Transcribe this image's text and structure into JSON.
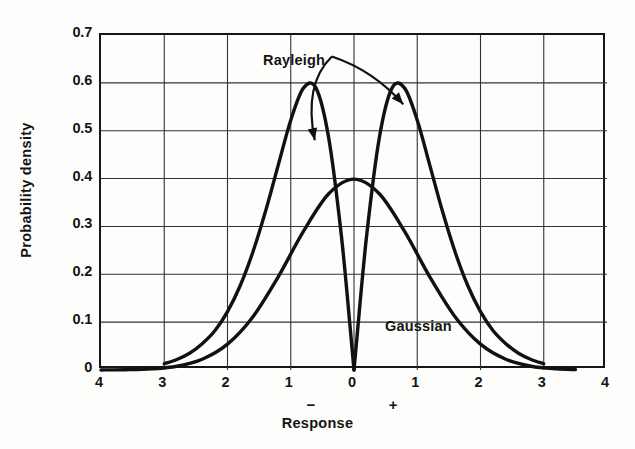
{
  "chart_data": {
    "type": "line",
    "title": "",
    "xlabel": "Response",
    "ylabel": "Probability density",
    "xlim": [
      -4,
      4
    ],
    "ylim": [
      0,
      0.7
    ],
    "grid": true,
    "legend_position": "inline-annotations",
    "y_ticks": [
      "0.7",
      "0.6",
      "0.5",
      "0.4",
      "0.3",
      "0.2",
      "0.1",
      "0"
    ],
    "y_tick_values": [
      0.7,
      0.6,
      0.5,
      0.4,
      0.3,
      0.2,
      0.1,
      0
    ],
    "x_ticks": [
      "4",
      "3",
      "2",
      "1",
      "0",
      "1",
      "2",
      "3",
      "4"
    ],
    "x_tick_values": [
      -4,
      -3,
      -2,
      -1,
      0,
      1,
      2,
      3,
      4
    ],
    "axis_sign_marks": [
      {
        "symbol": "−",
        "x": -0.65
      },
      {
        "symbol": "+",
        "x": 0.65
      }
    ],
    "annotations": [
      {
        "text": "Rayleigh",
        "x": -0.35,
        "y": 0.655,
        "points_to": [
          {
            "x": -0.62,
            "y": 0.48
          },
          {
            "x": 0.78,
            "y": 0.555
          }
        ]
      },
      {
        "text": "Gaussian",
        "x": 1.6,
        "y": 0.115
      }
    ],
    "series": [
      {
        "name": "Rayleigh",
        "color": "#111111",
        "peak_value": 0.6,
        "peak_x": [
          -1,
          1
        ],
        "zero_at": 0,
        "x": [
          -3.0,
          -2.8,
          -2.6,
          -2.4,
          -2.2,
          -2.0,
          -1.8,
          -1.6,
          -1.4,
          -1.2,
          -1.0,
          -0.8,
          -0.6,
          -0.4,
          -0.2,
          -0.05,
          0.0,
          0.05,
          0.2,
          0.4,
          0.6,
          0.8,
          1.0,
          1.2,
          1.4,
          1.6,
          1.8,
          2.0,
          2.2,
          2.4,
          2.6,
          2.8,
          3.0
        ],
        "values": [
          0.013,
          0.022,
          0.035,
          0.055,
          0.082,
          0.122,
          0.176,
          0.246,
          0.331,
          0.427,
          0.522,
          0.589,
          0.589,
          0.485,
          0.281,
          0.073,
          0.0,
          0.073,
          0.281,
          0.485,
          0.589,
          0.589,
          0.522,
          0.427,
          0.331,
          0.246,
          0.176,
          0.122,
          0.082,
          0.055,
          0.035,
          0.022,
          0.013
        ]
      },
      {
        "name": "Gaussian",
        "color": "#111111",
        "peak_value": 0.4,
        "peak_x": [
          0
        ],
        "sigma": 1,
        "x": [
          -4.0,
          -3.6,
          -3.2,
          -2.8,
          -2.4,
          -2.0,
          -1.6,
          -1.2,
          -0.8,
          -0.4,
          0.0,
          0.4,
          0.8,
          1.2,
          1.6,
          2.0,
          2.4,
          2.8,
          3.2,
          3.5
        ],
        "values": [
          0.0001,
          0.0006,
          0.0024,
          0.0079,
          0.0224,
          0.054,
          0.1109,
          0.1942,
          0.2897,
          0.3683,
          0.3989,
          0.3683,
          0.2897,
          0.1942,
          0.1109,
          0.054,
          0.0224,
          0.0079,
          0.0024,
          0.0009
        ]
      }
    ]
  },
  "axis": {
    "ylabel": "Probability density",
    "xlabel": "Response"
  },
  "labels": {
    "rayleigh": "Rayleigh",
    "gaussian": "Gaussian"
  }
}
